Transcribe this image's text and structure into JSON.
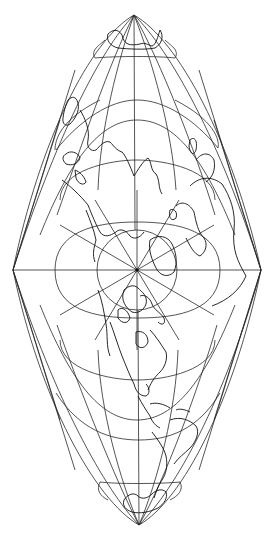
{
  "map": {
    "type": "world-map-projection",
    "description": "Polar-centered diamond/lens-shaped world map projection with graticule",
    "background_color": "#ffffff",
    "line_color": "#2a2a2a",
    "coastline_color": "#111111",
    "center_pole": {
      "x": 137,
      "y": 270
    },
    "vertices": {
      "top": {
        "x": 134,
        "y": 15
      },
      "bottom": {
        "x": 139,
        "y": 525
      },
      "left": {
        "x": 13,
        "y": 270
      },
      "right": {
        "x": 261,
        "y": 270
      }
    },
    "landmasses_visible": [
      "Asia",
      "Europe",
      "Africa",
      "North America",
      "South America",
      "Greenland",
      "Antarctica",
      "Australia"
    ]
  }
}
